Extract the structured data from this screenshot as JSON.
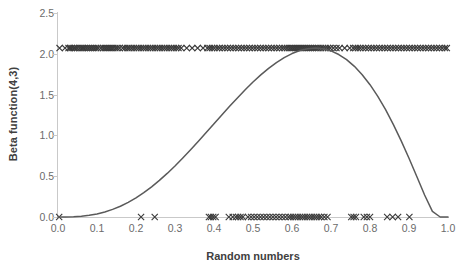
{
  "chart_data": {
    "type": "line",
    "title": "",
    "xlabel": "Random numbers",
    "ylabel": "Beta function(4,3)",
    "xlim": [
      0.0,
      1.0
    ],
    "ylim": [
      0.0,
      2.5
    ],
    "grid": false,
    "legend": null,
    "xticks": [
      "0.0",
      "0.1",
      "0.2",
      "0.3",
      "0.4",
      "0.5",
      "0.6",
      "0.7",
      "0.8",
      "0.9",
      "1.0"
    ],
    "xtick_values": [
      0.0,
      0.1,
      0.2,
      0.3,
      0.4,
      0.5,
      0.6,
      0.7,
      0.8,
      0.9,
      1.0
    ],
    "yticks": [
      "0.0",
      "0.5",
      "1.0",
      "1.5",
      "2.0",
      "2.5"
    ],
    "ytick_values": [
      0.0,
      0.5,
      1.0,
      1.5,
      2.0,
      2.5
    ],
    "series": [
      {
        "name": "Beta(4,3) density curve",
        "type": "line",
        "color": "#5a5a5a",
        "x": [
          0.0,
          0.02,
          0.04,
          0.06,
          0.08,
          0.1,
          0.12,
          0.14,
          0.16,
          0.18,
          0.2,
          0.22,
          0.24,
          0.26,
          0.28,
          0.3,
          0.32,
          0.34,
          0.36,
          0.38,
          0.4,
          0.42,
          0.44,
          0.46,
          0.48,
          0.5,
          0.52,
          0.54,
          0.56,
          0.58,
          0.6,
          0.62,
          0.64,
          0.66,
          0.68,
          0.7,
          0.72,
          0.74,
          0.76,
          0.78,
          0.8,
          0.82,
          0.84,
          0.86,
          0.88,
          0.9,
          0.92,
          0.94,
          0.96,
          0.98,
          1.0
        ],
        "y": [
          0.0,
          0.0,
          0.002,
          0.007,
          0.016,
          0.029,
          0.048,
          0.072,
          0.102,
          0.139,
          0.182,
          0.231,
          0.286,
          0.347,
          0.413,
          0.484,
          0.559,
          0.637,
          0.718,
          0.8,
          0.884,
          0.967,
          1.049,
          1.129,
          1.206,
          1.279,
          1.347,
          1.409,
          1.464,
          1.511,
          1.549,
          1.578,
          1.595,
          1.601,
          1.594,
          1.574,
          1.54,
          1.492,
          1.428,
          1.349,
          1.254,
          1.143,
          1.017,
          0.876,
          0.722,
          0.557,
          0.384,
          0.209,
          0.053,
          0.0,
          0.0
        ],
        "y_scaled_note": "curve drawn scaled so its maximum aligns with 2.07 on the y axis"
      },
      {
        "name": "Sampled random numbers (upper band)",
        "type": "scatter",
        "marker": "x",
        "color": "#3a3a3a",
        "y_constant": 2.07,
        "x": [
          0.004,
          0.018,
          0.027,
          0.031,
          0.035,
          0.04,
          0.044,
          0.049,
          0.055,
          0.06,
          0.064,
          0.068,
          0.073,
          0.078,
          0.083,
          0.088,
          0.093,
          0.098,
          0.103,
          0.11,
          0.116,
          0.121,
          0.126,
          0.131,
          0.136,
          0.141,
          0.147,
          0.152,
          0.158,
          0.166,
          0.172,
          0.178,
          0.183,
          0.189,
          0.195,
          0.201,
          0.207,
          0.213,
          0.219,
          0.225,
          0.231,
          0.237,
          0.243,
          0.249,
          0.255,
          0.261,
          0.267,
          0.273,
          0.279,
          0.285,
          0.291,
          0.297,
          0.303,
          0.309,
          0.316,
          0.33,
          0.344,
          0.358,
          0.372,
          0.383,
          0.389,
          0.395,
          0.401,
          0.408,
          0.414,
          0.421,
          0.428,
          0.435,
          0.442,
          0.449,
          0.456,
          0.463,
          0.47,
          0.477,
          0.484,
          0.491,
          0.498,
          0.505,
          0.512,
          0.519,
          0.526,
          0.533,
          0.54,
          0.547,
          0.554,
          0.561,
          0.568,
          0.575,
          0.581,
          0.587,
          0.593,
          0.598,
          0.603,
          0.608,
          0.613,
          0.618,
          0.623,
          0.628,
          0.633,
          0.638,
          0.643,
          0.648,
          0.653,
          0.658,
          0.663,
          0.668,
          0.674,
          0.68,
          0.686,
          0.692,
          0.698,
          0.706,
          0.714,
          0.722,
          0.735,
          0.748,
          0.757,
          0.763,
          0.769,
          0.775,
          0.782,
          0.789,
          0.796,
          0.803,
          0.81,
          0.817,
          0.824,
          0.831,
          0.838,
          0.845,
          0.852,
          0.859,
          0.866,
          0.873,
          0.88,
          0.887,
          0.894,
          0.901,
          0.908,
          0.915,
          0.922,
          0.929,
          0.936,
          0.943,
          0.95,
          0.957,
          0.964,
          0.971,
          0.978,
          0.985,
          0.992,
          0.997
        ]
      },
      {
        "name": "Sampled random numbers (baseline band)",
        "type": "scatter",
        "marker": "x",
        "color": "#3a3a3a",
        "y_constant": 0.0,
        "x": [
          0.003,
          0.213,
          0.248,
          0.387,
          0.392,
          0.398,
          0.404,
          0.438,
          0.448,
          0.456,
          0.462,
          0.468,
          0.474,
          0.487,
          0.495,
          0.503,
          0.511,
          0.519,
          0.527,
          0.535,
          0.543,
          0.551,
          0.559,
          0.567,
          0.575,
          0.583,
          0.591,
          0.597,
          0.603,
          0.609,
          0.615,
          0.621,
          0.627,
          0.633,
          0.639,
          0.645,
          0.651,
          0.657,
          0.663,
          0.669,
          0.675,
          0.683,
          0.691,
          0.752,
          0.758,
          0.764,
          0.784,
          0.792,
          0.8,
          0.844,
          0.858,
          0.872,
          0.901
        ]
      }
    ]
  }
}
